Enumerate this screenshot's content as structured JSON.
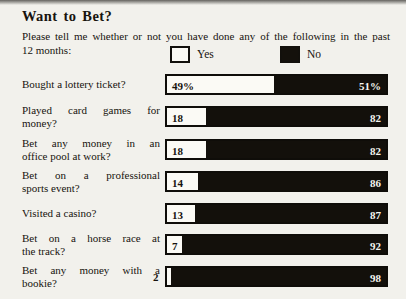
{
  "page": {
    "title": "Want to Bet?",
    "subtitle_line1": "Please tell me whether or not you have done any of the following in the past",
    "subtitle_line2": "12 months:"
  },
  "legend": {
    "yes_label": "Yes",
    "no_label": "No"
  },
  "colors": {
    "paper": "#f2f1ec",
    "ink": "#17130e",
    "bar_black": "#13100b",
    "bar_white": "#fbfaf5"
  },
  "chart_data": {
    "type": "bar",
    "orientation": "horizontal",
    "stacked": true,
    "title": "Want to Bet?",
    "subtitle": "Please tell me whether or not you have done any of the following in the past 12 months:",
    "legend_position": "top",
    "legend_entries": [
      "Yes",
      "No"
    ],
    "axis": "none",
    "xlim": [
      0,
      100
    ],
    "categories": [
      "Bought a lottery ticket?",
      "Played card games for money?",
      "Bet any money in an office pool at work?",
      "Bet on a professional sports event?",
      "Visited a casino?",
      "Bet on a horse race at the track?",
      "Bet any money with a bookie?"
    ],
    "series": [
      {
        "name": "Yes",
        "values": [
          49,
          18,
          18,
          14,
          13,
          7,
          2
        ]
      },
      {
        "name": "No",
        "values": [
          51,
          82,
          82,
          86,
          87,
          92,
          98
        ]
      }
    ],
    "value_labels": [
      {
        "yes": "49%",
        "no": "51%"
      },
      {
        "yes": "18",
        "no": "82"
      },
      {
        "yes": "18",
        "no": "82"
      },
      {
        "yes": "14",
        "no": "86"
      },
      {
        "yes": "13",
        "no": "87"
      },
      {
        "yes": "7",
        "no": "92"
      },
      {
        "yes": "2",
        "no": "98"
      }
    ]
  },
  "rows": [
    {
      "line1": "Bought a lottery ticket?",
      "line2": ""
    },
    {
      "line1": "Played card games for",
      "line2": "money?"
    },
    {
      "line1": "Bet any money in an",
      "line2": "office pool at work?"
    },
    {
      "line1": "Bet on a professional",
      "line2": "sports event?"
    },
    {
      "line1": "Visited a casino?",
      "line2": ""
    },
    {
      "line1": "Bet on a horse race at",
      "line2": "the track?"
    },
    {
      "line1": "Bet any money with a",
      "line2": "bookie?"
    }
  ]
}
